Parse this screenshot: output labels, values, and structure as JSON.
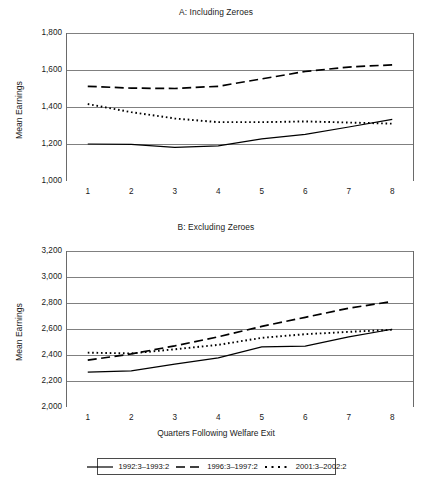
{
  "figure": {
    "xlabel": "Quarters Following Welfare Exit"
  },
  "legend": {
    "entries": [
      {
        "label": "1992:3–1993:2",
        "style": "solid",
        "icon": "solid-line-swatch"
      },
      {
        "label": "1996:3–1997:2",
        "style": "dashed",
        "icon": "dashed-line-swatch"
      },
      {
        "label": "2001:3–2002:2",
        "style": "dotted",
        "icon": "dotted-line-swatch"
      }
    ]
  },
  "chart_data": [
    {
      "id": "A",
      "type": "line",
      "title": "A: Including Zeroes",
      "xlabel": "",
      "ylabel": "Mean Earnings",
      "categories": [
        1,
        2,
        3,
        4,
        5,
        6,
        7,
        8
      ],
      "xticklabels": [
        "1",
        "2",
        "3",
        "4",
        "5",
        "6",
        "7",
        "8"
      ],
      "yticks": [
        1000,
        1200,
        1400,
        1600,
        1800
      ],
      "yticklabels": [
        "1,000",
        "1,200",
        "1,400",
        "1,600",
        "1,800"
      ],
      "ylim": [
        1000,
        1800
      ],
      "grid": "horizontal",
      "legend_position": "below-figure",
      "series": [
        {
          "name": "1992:3–1993:2",
          "style": "solid",
          "values": [
            1200,
            1198,
            1182,
            1190,
            1228,
            1252,
            1292,
            1333
          ]
        },
        {
          "name": "1996:3–1997:2",
          "style": "dashed",
          "values": [
            1512,
            1502,
            1500,
            1512,
            1552,
            1592,
            1616,
            1628
          ]
        },
        {
          "name": "2001:3–2002:2",
          "style": "dotted",
          "values": [
            1416,
            1372,
            1338,
            1318,
            1318,
            1322,
            1316,
            1310
          ]
        }
      ]
    },
    {
      "id": "B",
      "type": "line",
      "title": "B: Excluding Zeroes",
      "xlabel": "Quarters Following Welfare Exit",
      "ylabel": "Mean Earnings",
      "categories": [
        1,
        2,
        3,
        4,
        5,
        6,
        7,
        8
      ],
      "xticklabels": [
        "1",
        "2",
        "3",
        "4",
        "5",
        "6",
        "7",
        "8"
      ],
      "yticks": [
        2000,
        2200,
        2400,
        2600,
        2800,
        3000,
        3200
      ],
      "yticklabels": [
        "2,000",
        "2,200",
        "2,400",
        "2,600",
        "2,800",
        "3,000",
        "3,200"
      ],
      "ylim": [
        2000,
        3200
      ],
      "grid": "horizontal",
      "legend_position": "below-figure",
      "series": [
        {
          "name": "1992:3–1993:2",
          "style": "solid",
          "values": [
            2268,
            2278,
            2330,
            2378,
            2462,
            2468,
            2540,
            2598
          ]
        },
        {
          "name": "1996:3–1997:2",
          "style": "dashed",
          "values": [
            2360,
            2408,
            2470,
            2540,
            2620,
            2690,
            2760,
            2812
          ]
        },
        {
          "name": "2001:3–2002:2",
          "style": "dotted",
          "values": [
            2418,
            2412,
            2444,
            2478,
            2532,
            2560,
            2578,
            2594
          ]
        }
      ]
    }
  ]
}
